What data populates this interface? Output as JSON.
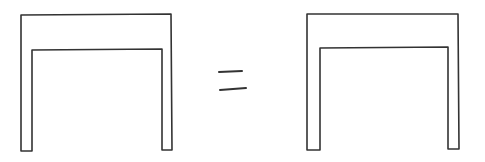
{
  "diagram": {
    "background": "#ffffff",
    "stroke_color": "#333333",
    "stroke_width": 1.6,
    "shapes": [
      {
        "name": "left-arch-shape",
        "description": "Hand-drawn inverted U / doorway frame (outer rectangle with inner cutout)",
        "points": [
          [
            21,
            151
          ],
          [
            21,
            15
          ],
          [
            171,
            14
          ],
          [
            172,
            150
          ],
          [
            162,
            150
          ],
          [
            162,
            49
          ],
          [
            32,
            50
          ],
          [
            32,
            151
          ],
          [
            21,
            151
          ]
        ]
      },
      {
        "name": "right-arch-shape",
        "description": "Hand-drawn inverted U / doorway frame (outer rectangle with inner cutout)",
        "points": [
          [
            307,
            150
          ],
          [
            307,
            14
          ],
          [
            458,
            14
          ],
          [
            459,
            149
          ],
          [
            448,
            149
          ],
          [
            448,
            47
          ],
          [
            320,
            48
          ],
          [
            320,
            150
          ],
          [
            307,
            150
          ]
        ]
      }
    ],
    "equals_sign": {
      "name": "equals-sign",
      "top_line": [
        [
          219,
          72
        ],
        [
          242,
          71
        ]
      ],
      "bottom_line": [
        [
          220,
          90
        ],
        [
          246,
          88
        ]
      ]
    }
  }
}
